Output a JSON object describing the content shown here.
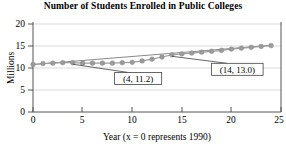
{
  "chart_data": {
    "type": "line",
    "title": "Number of Students Enrolled in Public Colleges",
    "xlabel": "Year (x = 0 represents 1990)",
    "ylabel": "Millions",
    "xlim": [
      0,
      25
    ],
    "ylim": [
      0,
      20
    ],
    "xticks": [
      0,
      5,
      10,
      15,
      20,
      25
    ],
    "yticks": [
      0,
      5,
      10,
      15,
      20
    ],
    "xtick_labels": [
      "0",
      "5",
      "10",
      "15",
      "20",
      "25"
    ],
    "ytick_labels": [
      "0",
      "5",
      "10",
      "15",
      "20"
    ],
    "grid": true,
    "grid_axis": "y",
    "legend": false,
    "marker": "filled-circle",
    "marker_color": "#9a9a9a",
    "line_color": "#8a8a8a",
    "series": [
      {
        "name": "Public college enrollment",
        "x": [
          0,
          1,
          2,
          3,
          4,
          5,
          6,
          7,
          8,
          9,
          10,
          11,
          12,
          13,
          14,
          15,
          16,
          17,
          18,
          19,
          20,
          21,
          22,
          23,
          24
        ],
        "values": [
          10.8,
          11.0,
          11.1,
          11.2,
          11.2,
          11.1,
          11.1,
          11.1,
          11.1,
          11.2,
          11.3,
          11.6,
          12.0,
          12.5,
          13.0,
          13.2,
          13.4,
          13.6,
          13.8,
          14.0,
          14.3,
          14.5,
          14.7,
          14.9,
          15.1
        ]
      }
    ],
    "trend_line": {
      "name": "secant-line",
      "from": {
        "x": 0,
        "y": 10.78
      },
      "to": {
        "x": 24,
        "y": 15.18
      }
    },
    "annotations": [
      {
        "id": "point-a",
        "label": "(4, 11.2)",
        "point": {
          "x": 4,
          "y": 11.2
        },
        "box_center": {
          "x": 10.6,
          "y": 7.6
        }
      },
      {
        "id": "point-b",
        "label": "(14, 13.0)",
        "point": {
          "x": 14,
          "y": 13.0
        },
        "box_center": {
          "x": 20.6,
          "y": 9.7
        }
      }
    ]
  }
}
